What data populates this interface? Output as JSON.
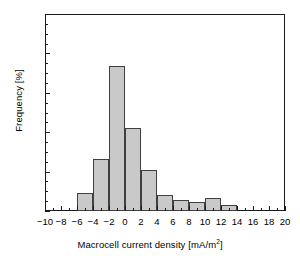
{
  "chart_data": {
    "type": "bar",
    "title": "",
    "subtitle": "",
    "xlabel_text": "Macrocell current density [mA/m",
    "xlabel_sup": "2",
    "xlabel_tail": "]",
    "xlabel_full": "Macrocell current density [mA/m2]",
    "ylabel": "Frequency [%]",
    "xlim": [
      -10,
      20
    ],
    "ylim": [
      0,
      50
    ],
    "grid": false,
    "legend": null,
    "bin_width": 2,
    "x_major_ticks": [
      -10,
      -8,
      -6,
      -4,
      -2,
      0,
      2,
      4,
      6,
      8,
      10,
      12,
      14,
      16,
      18,
      20
    ],
    "x_tick_labels": [
      "−10",
      "−8",
      "−6",
      "−4",
      "−2",
      "0",
      "2",
      "4",
      "6",
      "8",
      "10",
      "12",
      "14",
      "16",
      "18",
      "20"
    ],
    "x_minor_step": 1,
    "y_major_ticks": [
      0,
      10,
      20,
      30,
      40,
      50
    ],
    "y_tick_labels": [
      "0",
      "10",
      "20",
      "30",
      "40",
      "50"
    ],
    "y_minor_step": 2.5,
    "bin_edges": [
      -6,
      -4,
      -2,
      0,
      2,
      4,
      6,
      8,
      10,
      12,
      14
    ],
    "categories": [
      "-6 to -4",
      "-4 to -2",
      "-2 to 0",
      "0 to 2",
      "2 to 4",
      "4 to 6",
      "6 to 8",
      "8 to 10",
      "10 to 12",
      "12 to 14"
    ],
    "bin_centers": [
      -5,
      -3,
      -1,
      1,
      3,
      5,
      7,
      9,
      11,
      13
    ],
    "values": [
      4.5,
      13.3,
      36.8,
      21.0,
      10.4,
      4.0,
      2.7,
      2.2,
      3.4,
      1.6
    ],
    "bar_fill_color": "#c9c9c9",
    "bar_edge_color": "#404040",
    "axis_color": "#1a1a1a",
    "background_color": "#ffffff"
  },
  "caption": {
    "smudge_line": ""
  }
}
